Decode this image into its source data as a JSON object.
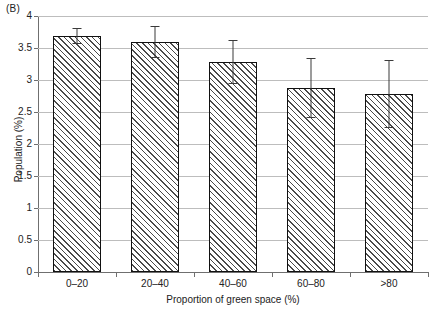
{
  "panel": {
    "label": "(B)"
  },
  "chart_data": {
    "type": "bar",
    "title": "(B)",
    "xlabel": "Proportion of green space (%)",
    "ylabel": "Population (%)",
    "categories": [
      "0–20",
      "20–40",
      "40–60",
      "60–80",
      ">80"
    ],
    "values": [
      3.69,
      3.59,
      3.28,
      2.88,
      2.78
    ],
    "errors": [
      0.12,
      0.25,
      0.34,
      0.47,
      0.53
    ],
    "error_type": "symmetric",
    "ylim": [
      0,
      4
    ],
    "yticks": [
      "0",
      "0.5",
      "1",
      "1.5",
      "2",
      "2.5",
      "3",
      "3.5",
      "4"
    ],
    "ytick_values": [
      0,
      0.5,
      1,
      1.5,
      2,
      2.5,
      3,
      3.5,
      4
    ],
    "grid": "horizontal",
    "legend": "none",
    "bar_fill": "diagonal-hatch",
    "bar_edge_color": "#111111",
    "grid_color": "#bdbdbd",
    "axis_color": "#6f6f6f"
  }
}
